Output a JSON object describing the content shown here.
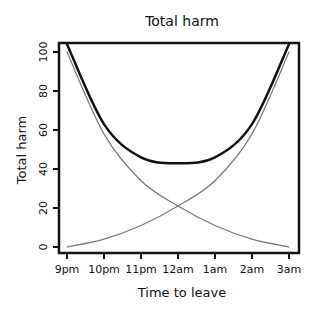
{
  "chart_data": {
    "type": "line",
    "title": "Total harm",
    "xlabel": "Time to leave",
    "ylabel": "Total harm",
    "categories": [
      "9pm",
      "10pm",
      "11pm",
      "12am",
      "1am",
      "2am",
      "3am"
    ],
    "yticks": [
      0,
      20,
      40,
      60,
      80,
      100
    ],
    "ylim": [
      0,
      104
    ],
    "grid": false,
    "legend": null,
    "style": "xkcd",
    "series": [
      {
        "name": "Total harm",
        "color": "#111111",
        "width": 2.5,
        "values": [
          104,
          63,
          46,
          43,
          46,
          63,
          104
        ]
      },
      {
        "name": "Harm from leaving early",
        "color": "#777777",
        "width": 1.2,
        "values": [
          100,
          58,
          34,
          21,
          11,
          4,
          0
        ]
      },
      {
        "name": "Harm from staying late",
        "color": "#777777",
        "width": 1.2,
        "values": [
          0,
          4,
          11,
          21,
          34,
          58,
          100
        ]
      }
    ]
  }
}
